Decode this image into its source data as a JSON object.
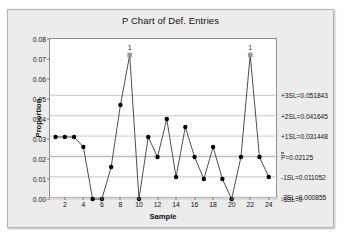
{
  "window": {
    "name": "minitab-chart-window"
  },
  "chart_data": {
    "type": "line",
    "title": "P Chart of Def. Entries",
    "xlabel": "Sample",
    "ylabel": "Proportion",
    "xlim": [
      0.4,
      25.0
    ],
    "ylim": [
      0.0,
      0.08
    ],
    "grid": true,
    "legend": "none",
    "x": [
      1,
      2,
      3,
      4,
      5,
      6,
      7,
      8,
      9,
      10,
      11,
      12,
      13,
      14,
      15,
      16,
      17,
      18,
      19,
      20,
      21,
      22,
      23,
      24
    ],
    "values": [
      0.031,
      0.031,
      0.031,
      0.026,
      0.0,
      0.0,
      0.016,
      0.047,
      0.072,
      0.0,
      0.031,
      0.021,
      0.04,
      0.011,
      0.036,
      0.021,
      0.01,
      0.026,
      0.01,
      0.0,
      0.021,
      0.072,
      0.021,
      0.011
    ],
    "series_name": "Proportion",
    "ytick_labels": [
      "0.08",
      "0.07",
      "0.06",
      "0.05",
      "0.04",
      "0.03",
      "0.02",
      "0.01",
      "0.00"
    ],
    "ytick_values": [
      0.08,
      0.07,
      0.06,
      0.05,
      0.04,
      0.03,
      0.02,
      0.01,
      0.0
    ],
    "xtick_labels": [
      "2",
      "4",
      "6",
      "8",
      "10",
      "12",
      "14",
      "16",
      "18",
      "20",
      "22",
      "24"
    ],
    "xtick_values": [
      2,
      4,
      6,
      8,
      10,
      12,
      14,
      16,
      18,
      20,
      22,
      24
    ],
    "control_limits": [
      {
        "name": "+3SL",
        "label": "+3SL=0.051843",
        "value": 0.051843
      },
      {
        "name": "+2SL",
        "label": "+2SL=0.041645",
        "value": 0.041645
      },
      {
        "name": "+1SL",
        "label": "+1SL=0.031448",
        "value": 0.031448
      },
      {
        "name": "PBAR",
        "label": "=0.02125",
        "value": 0.02125,
        "prefix": "P"
      },
      {
        "name": "-1SL",
        "label": "-1SL=0.011052",
        "value": 0.011052
      },
      {
        "name": "-2SL",
        "label": "-2SL=0.000855",
        "value": 0.000855
      },
      {
        "name": "-3SL",
        "label": "-3SL=0",
        "value": 0.0
      }
    ],
    "violations": [
      {
        "sample": 9,
        "value": 0.072,
        "label": "1"
      },
      {
        "sample": 22,
        "value": 0.072,
        "label": "1"
      }
    ],
    "colors": {
      "series_line": "#3a3a3a",
      "marker": "#000000",
      "limit_line": "#c8c8c8",
      "center_line": "#bdbdbd",
      "violation_marker": "#9a9a9a",
      "plot_bg": "#ffffff",
      "window_bg": "#ececec",
      "axis": "#8e8e8e"
    }
  }
}
